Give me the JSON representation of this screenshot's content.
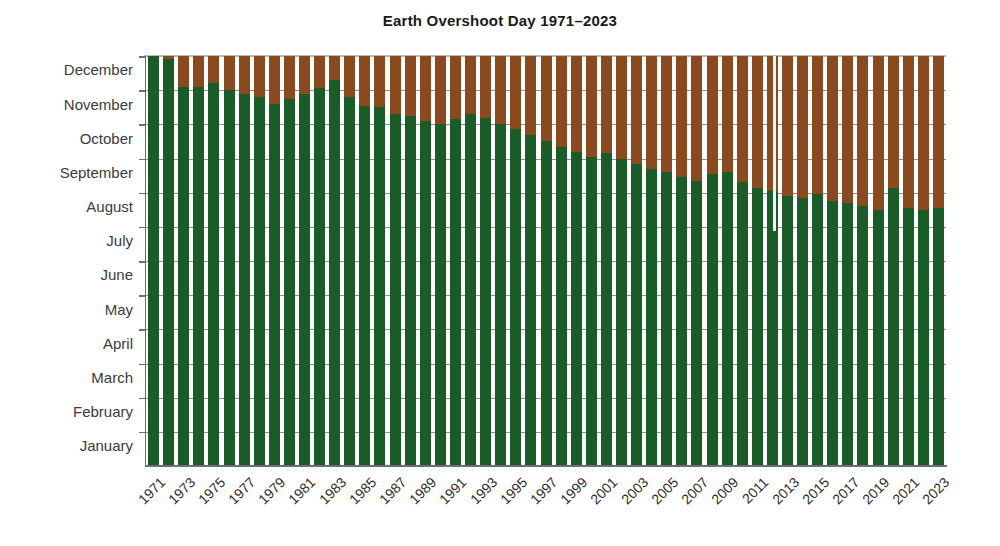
{
  "chart_data": {
    "type": "bar",
    "title": "Earth Overshoot Day 1971–2023",
    "xlabel": "",
    "ylabel": "",
    "stacked": true,
    "grid": true,
    "legend": "none",
    "y_axis": {
      "kind": "day-of-year",
      "direction": "January at bottom, December at top",
      "tick_labels": [
        "December",
        "November",
        "October",
        "September",
        "August",
        "July",
        "June",
        "May",
        "April",
        "March",
        "February",
        "January"
      ],
      "ylim": [
        0,
        12
      ]
    },
    "x_axis": {
      "tick_labels": [
        "1971",
        "1973",
        "1975",
        "1977",
        "1979",
        "1981",
        "1983",
        "1985",
        "1987",
        "1989",
        "1991",
        "1993",
        "1995",
        "1997",
        "1999",
        "2001",
        "2003",
        "2005",
        "2007",
        "2009",
        "2011",
        "2013",
        "2015",
        "2017",
        "2019",
        "2021",
        "2023"
      ],
      "tick_label_rotation_deg": -45,
      "label_interval_years": 2
    },
    "series": [
      {
        "name": "Within biocapacity budget",
        "color": "#1a5c28",
        "stack_order": "bottom"
      },
      {
        "name": "Ecological overshoot",
        "color": "#8b4a1e",
        "stack_order": "top"
      }
    ],
    "categories": [
      "1971",
      "1972",
      "1973",
      "1974",
      "1975",
      "1976",
      "1977",
      "1978",
      "1979",
      "1980",
      "1981",
      "1982",
      "1983",
      "1984",
      "1985",
      "1986",
      "1987",
      "1988",
      "1989",
      "1990",
      "1991",
      "1992",
      "1993",
      "1994",
      "1995",
      "1996",
      "1997",
      "1998",
      "1999",
      "2000",
      "2001",
      "2002",
      "2003",
      "2004",
      "2005",
      "2006",
      "2007",
      "2008",
      "2009",
      "2010",
      "2011",
      "2012",
      "2013",
      "2014",
      "2015",
      "2016",
      "2017",
      "2018",
      "2019",
      "2020",
      "2021",
      "2022",
      "2023"
    ],
    "values_month_fraction": [
      12.0,
      11.9,
      11.1,
      11.1,
      11.2,
      11.0,
      10.9,
      10.8,
      10.6,
      10.75,
      10.9,
      11.05,
      11.3,
      10.8,
      10.55,
      10.5,
      10.3,
      10.25,
      10.1,
      10.0,
      10.15,
      10.3,
      10.2,
      10.0,
      9.85,
      9.7,
      9.5,
      9.35,
      9.2,
      9.05,
      9.15,
      9.0,
      8.85,
      8.7,
      8.6,
      8.45,
      8.35,
      8.55,
      8.6,
      8.3,
      8.15,
      8.05,
      7.9,
      7.85,
      7.95,
      7.75,
      7.7,
      7.6,
      7.5,
      8.15,
      7.55,
      7.5,
      7.55
    ],
    "overshoot_day_labels": [
      "December 31",
      "December 27",
      "November 30",
      "November 29",
      "December 2",
      "November 26",
      "November 23",
      "November 20",
      "November 15",
      "November 20",
      "November 26",
      "December 1",
      "December 8",
      "November 22",
      "November 14",
      "November 12",
      "November 6",
      "November 5",
      "October 31",
      "October 28",
      "November 2",
      "November 6",
      "November 3",
      "October 28",
      "October 23",
      "October 18",
      "October 12",
      "October 7",
      "October 2",
      "September 26",
      "September 30",
      "September 25",
      "September 20",
      "September 15",
      "September 12",
      "September 7",
      "September 4",
      "September 11",
      "September 13",
      "September 2",
      "August 28",
      "August 24",
      "August 18",
      "August 16",
      "August 20",
      "August 13",
      "August 11",
      "August 6",
      "August 2",
      "September 4",
      "July 30",
      "July 29",
      "August 2"
    ],
    "annotations": [
      "1971–1972 bars reach the top of the scale (no measurable overshoot).",
      "2020 shows a pronounced rebound to early September caused by the pandemic slowdown.",
      "Overall trend: Earth Overshoot Day moves steadily earlier in the year."
    ]
  }
}
